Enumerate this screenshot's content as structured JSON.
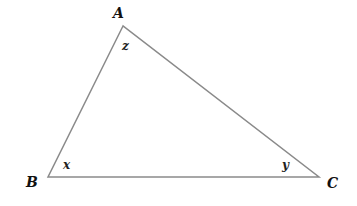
{
  "diagram": {
    "type": "triangle",
    "vertices": [
      {
        "label": "A",
        "x": 123,
        "y": 26
      },
      {
        "label": "B",
        "x": 48,
        "y": 177
      },
      {
        "label": "C",
        "x": 319,
        "y": 177
      }
    ],
    "angles": [
      {
        "vertex": "A",
        "label": "z"
      },
      {
        "vertex": "B",
        "label": "x"
      },
      {
        "vertex": "C",
        "label": "y"
      }
    ],
    "line_color": "#8a8a8a"
  }
}
